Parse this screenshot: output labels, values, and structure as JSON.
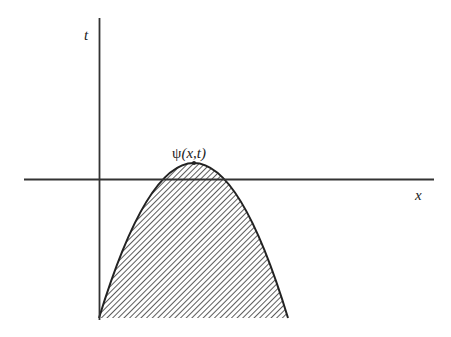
{
  "diagram": {
    "axes": {
      "t_label": "t",
      "x_label": "x"
    },
    "curve": {
      "label_psi": "ψ",
      "label_args": "(x,t)",
      "fill": "diagonal-hatch",
      "line_color": "#222222"
    }
  }
}
